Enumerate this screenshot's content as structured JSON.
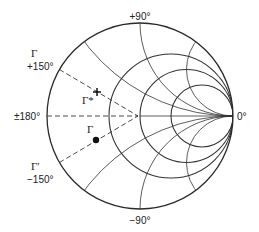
{
  "diagram": {
    "type": "smith-chart",
    "colors": {
      "line": "#333333",
      "outer": "#2a2a2a",
      "text": "#222222",
      "background": "#ffffff"
    },
    "geometry": {
      "cx": 140,
      "cy": 116,
      "R": 93
    },
    "resistance_circles": [
      0.5,
      1,
      2
    ],
    "reactance_arcs": [
      0.5,
      1,
      2,
      -0.5,
      -1,
      -2
    ],
    "angle_labels": [
      {
        "id": "top",
        "text": "+90°",
        "x": 140,
        "y": 20,
        "anchor": "middle"
      },
      {
        "id": "bottom",
        "text": "−90°",
        "x": 140,
        "y": 224,
        "anchor": "middle"
      },
      {
        "id": "right",
        "text": "0°",
        "x": 237,
        "y": 120,
        "anchor": "start"
      },
      {
        "id": "left",
        "text": "±180°",
        "x": 14,
        "y": 120,
        "anchor": "start"
      },
      {
        "id": "upper-left",
        "text": "+150°",
        "x": 27,
        "y": 70,
        "anchor": "start"
      },
      {
        "id": "lower-left",
        "text": "−150°",
        "x": 27,
        "y": 183,
        "anchor": "start"
      }
    ],
    "symbol_labels": [
      {
        "id": "gamma-upper",
        "text": "Γ",
        "x": 31,
        "y": 57
      },
      {
        "id": "gamma-prime",
        "text": "Γ′",
        "x": 31,
        "y": 170
      },
      {
        "id": "gamma-star",
        "text": "Γ*",
        "x": 82,
        "y": 104
      },
      {
        "id": "gamma-point",
        "text": "Γ",
        "x": 87,
        "y": 133
      }
    ],
    "dashed_lines": [
      {
        "id": "line-plus-150",
        "angle_deg": 150
      },
      {
        "id": "line-180",
        "angle_deg": 180
      },
      {
        "id": "line-minus-150",
        "angle_deg": -150
      }
    ],
    "points": [
      {
        "id": "gamma-star-point",
        "symbol": "cross",
        "x": 97,
        "y": 92
      },
      {
        "id": "gamma-dot-point",
        "symbol": "dot",
        "x": 96,
        "y": 140
      }
    ]
  }
}
